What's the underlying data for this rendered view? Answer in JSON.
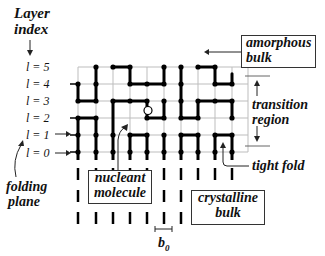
{
  "diagram": {
    "axis": {
      "label_line1": "Layer",
      "label_line2": "index"
    },
    "layers": [
      {
        "label": "l = 5",
        "row": 5
      },
      {
        "label": "l = 4",
        "row": 4
      },
      {
        "label": "l = 3",
        "row": 3
      },
      {
        "label": "l = 2",
        "row": 2
      },
      {
        "label": "l = 1",
        "row": 1
      },
      {
        "label": "l = 0",
        "row": 0
      }
    ],
    "annotations": {
      "amorphous_bulk": {
        "line1": "amorphous",
        "line2": "bulk"
      },
      "transition_region": {
        "line1": "transition",
        "line2": "region"
      },
      "tight_fold": "tight fold",
      "crystalline_bulk": {
        "line1": "crystalline",
        "line2": "bulk"
      },
      "nucleant_molecule": {
        "line1": "nucleant",
        "line2": "molecule"
      },
      "folding_plane": {
        "line1": "folding",
        "line2": "plane"
      },
      "lattice_spacing": "b",
      "lattice_spacing_sub": "0"
    },
    "colors": {
      "grid": "#bdbdbd",
      "chain": "#000000",
      "text": "#111111",
      "background": "#ffffff"
    },
    "lattice": {
      "columns_x": [
        78,
        96,
        113,
        130,
        147,
        164,
        181,
        198,
        215,
        232
      ],
      "rows_y": {
        "5": 67,
        "4": 84,
        "3": 101,
        "2": 118,
        "1": 135,
        "0": 152
      },
      "bonds": [
        [
          [
            1,
            5
          ],
          [
            1,
            3
          ]
        ],
        [
          [
            1,
            3
          ],
          [
            0,
            3
          ]
        ],
        [
          [
            0,
            3
          ],
          [
            0,
            4
          ]
        ],
        [
          [
            2,
            5
          ],
          [
            3,
            5
          ]
        ],
        [
          [
            3,
            5
          ],
          [
            3,
            4
          ]
        ],
        [
          [
            3,
            4
          ],
          [
            5,
            4
          ]
        ],
        [
          [
            5,
            4
          ],
          [
            5,
            5
          ]
        ],
        [
          [
            6,
            5
          ],
          [
            6,
            2
          ]
        ],
        [
          [
            6,
            2
          ],
          [
            7,
            2
          ]
        ],
        [
          [
            7,
            2
          ],
          [
            7,
            3
          ]
        ],
        [
          [
            7,
            3
          ],
          [
            9,
            3
          ]
        ],
        [
          [
            9,
            3
          ],
          [
            9,
            2
          ]
        ],
        [
          [
            7,
            5
          ],
          [
            8,
            5
          ]
        ],
        [
          [
            8,
            5
          ],
          [
            8,
            4
          ]
        ],
        [
          [
            8,
            4
          ],
          [
            9,
            4
          ]
        ],
        [
          [
            9,
            4
          ],
          [
            9,
            4.6
          ]
        ],
        [
          [
            2,
            3
          ],
          [
            4,
            3
          ]
        ],
        [
          [
            4,
            3
          ],
          [
            4,
            2
          ]
        ],
        [
          [
            4,
            2
          ],
          [
            5,
            2
          ]
        ],
        [
          [
            5,
            2
          ],
          [
            5,
            3
          ]
        ],
        [
          [
            2,
            3
          ],
          [
            2,
            0
          ]
        ],
        [
          [
            0,
            2
          ],
          [
            1,
            2
          ]
        ],
        [
          [
            1,
            2
          ],
          [
            1,
            0
          ]
        ],
        [
          [
            0,
            2
          ],
          [
            0,
            0
          ]
        ],
        [
          [
            3,
            1
          ],
          [
            4,
            1
          ]
        ],
        [
          [
            3,
            1
          ],
          [
            3,
            0
          ]
        ],
        [
          [
            4,
            1
          ],
          [
            4,
            0
          ]
        ],
        [
          [
            6,
            1
          ],
          [
            7,
            1
          ]
        ],
        [
          [
            6,
            1
          ],
          [
            6,
            0
          ]
        ],
        [
          [
            7,
            1
          ],
          [
            7,
            0
          ]
        ],
        [
          [
            8,
            1
          ],
          [
            9,
            1
          ]
        ],
        [
          [
            8,
            1
          ],
          [
            8,
            0
          ]
        ],
        [
          [
            9,
            1
          ],
          [
            9,
            0
          ]
        ],
        [
          [
            5,
            1
          ],
          [
            5,
            0
          ]
        ]
      ],
      "nodes": [
        [
          1,
          5
        ],
        [
          2,
          5
        ],
        [
          3,
          5
        ],
        [
          5,
          5
        ],
        [
          6,
          5
        ],
        [
          7,
          5
        ],
        [
          8,
          5
        ],
        [
          0,
          4
        ],
        [
          1,
          4
        ],
        [
          3,
          4
        ],
        [
          4,
          4
        ],
        [
          5,
          4
        ],
        [
          6,
          4
        ],
        [
          8,
          4
        ],
        [
          9,
          4
        ],
        [
          0,
          3
        ],
        [
          1,
          3
        ],
        [
          2,
          3
        ],
        [
          3,
          3
        ],
        [
          4,
          3
        ],
        [
          5,
          3
        ],
        [
          6,
          3
        ],
        [
          7,
          3
        ],
        [
          8,
          3
        ],
        [
          9,
          3
        ],
        [
          0,
          2
        ],
        [
          1,
          2
        ],
        [
          4,
          2
        ],
        [
          5,
          2
        ],
        [
          6,
          2
        ],
        [
          7,
          2
        ],
        [
          9,
          2
        ],
        [
          0,
          1
        ],
        [
          1,
          1
        ],
        [
          2,
          1
        ],
        [
          3,
          1
        ],
        [
          4,
          1
        ],
        [
          5,
          1
        ],
        [
          6,
          1
        ],
        [
          7,
          1
        ],
        [
          8,
          1
        ],
        [
          9,
          1
        ],
        [
          0,
          0
        ],
        [
          1,
          0
        ],
        [
          2,
          0
        ],
        [
          3,
          0
        ],
        [
          4,
          0
        ],
        [
          5,
          0
        ],
        [
          6,
          0
        ],
        [
          7,
          0
        ],
        [
          8,
          0
        ],
        [
          9,
          0
        ]
      ],
      "nucleant_site": [
        5,
        2.5
      ]
    }
  }
}
